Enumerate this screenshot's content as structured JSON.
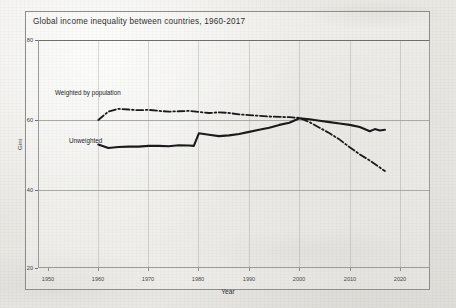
{
  "figure": {
    "title": "Global income inequality between countries, 1960-2017",
    "border_color": "#8d8d8a",
    "paper_color": "#eceae6",
    "ink_color": "#1a1a1a"
  },
  "axes": {
    "ylabel": "Gini",
    "xlabel": "Year",
    "ytick_labels": [
      "80",
      "60",
      "40",
      "20"
    ],
    "xtick_labels": [
      "1950",
      "1960",
      "1970",
      "1980",
      "1990",
      "2000",
      "2010",
      "2020"
    ]
  },
  "annotations": {
    "weighted": "Weighted by population",
    "unweighted": "Unweighted"
  },
  "chart_data": {
    "type": "line",
    "title": "Global income inequality between countries, 1960-2017",
    "xlabel": "Year",
    "ylabel": "Gini",
    "xlim": [
      1947,
      2024
    ],
    "ylim": [
      20,
      82
    ],
    "xticks": [
      1950,
      1960,
      1970,
      1980,
      1990,
      2000,
      2010,
      2020
    ],
    "yticks": [
      20,
      40,
      60,
      80
    ],
    "grid": "horizontal gridlines at 40, 60, 80; faint vertical gridlines at decade ticks",
    "legend": "inline annotations labelling each curve inside the plot area",
    "series": [
      {
        "name": "Weighted by population",
        "style": "dash-dot",
        "color": "#1a1a1a",
        "x": [
          1960,
          1962,
          1964,
          1966,
          1968,
          1970,
          1972,
          1974,
          1976,
          1978,
          1980,
          1982,
          1984,
          1986,
          1988,
          1990,
          1992,
          1994,
          1996,
          1998,
          2000,
          2002,
          2004,
          2006,
          2008,
          2010,
          2012,
          2014,
          2016,
          2017
        ],
        "values": [
          60.0,
          62.4,
          63.2,
          63.0,
          62.8,
          62.9,
          62.6,
          62.4,
          62.5,
          62.6,
          62.3,
          62.0,
          62.2,
          62.0,
          61.6,
          61.4,
          61.2,
          61.0,
          60.9,
          60.8,
          60.6,
          59.4,
          57.8,
          56.2,
          54.4,
          52.2,
          50.2,
          48.4,
          46.4,
          45.4
        ]
      },
      {
        "name": "Unweighted",
        "style": "solid",
        "color": "#1a1a1a",
        "x": [
          1960,
          1962,
          1964,
          1966,
          1968,
          1970,
          1972,
          1974,
          1976,
          1978,
          1979,
          1980,
          1982,
          1984,
          1986,
          1988,
          1990,
          1992,
          1994,
          1996,
          1998,
          2000,
          2002,
          2004,
          2006,
          2008,
          2010,
          2012,
          2014,
          2015,
          2016,
          2017
        ],
        "values": [
          53.0,
          52.0,
          52.3,
          52.4,
          52.4,
          52.6,
          52.6,
          52.5,
          52.8,
          52.7,
          52.6,
          56.2,
          55.8,
          55.4,
          55.6,
          56.0,
          56.6,
          57.2,
          57.8,
          58.6,
          59.2,
          60.5,
          60.2,
          59.8,
          59.4,
          59.0,
          58.6,
          58.0,
          56.8,
          57.4,
          57.0,
          57.2
        ]
      }
    ]
  }
}
